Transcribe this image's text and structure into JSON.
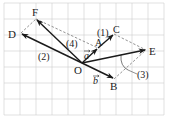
{
  "diagram": {
    "type": "vector-grid",
    "grid": {
      "x0": 4,
      "y0": 3,
      "cell": 16,
      "cols": 10,
      "rows": 7,
      "color": "#cfcfcf"
    },
    "colors": {
      "vector": "#1a1a1a",
      "dashed": "#777777",
      "label": "#222222"
    },
    "origin": {
      "name": "O",
      "x": 82,
      "y": 63
    },
    "points": [
      {
        "id": "A",
        "label": "A",
        "x": 98,
        "y": 48
      },
      {
        "id": "B",
        "label": "B",
        "x": 114,
        "y": 79
      },
      {
        "id": "C",
        "label": "C",
        "x": 114,
        "y": 34
      },
      {
        "id": "D",
        "label": "D",
        "x": 21,
        "y": 33
      },
      {
        "id": "E",
        "label": "E",
        "x": 146,
        "y": 50
      },
      {
        "id": "F",
        "label": "F",
        "x": 36,
        "y": 19
      }
    ],
    "vectors": [
      {
        "from": "O",
        "to": "A",
        "name": "a"
      },
      {
        "from": "O",
        "to": "B",
        "name": "b"
      },
      {
        "from": "A",
        "to": "C",
        "name": "(1)"
      },
      {
        "from": "O",
        "to": "D",
        "name": "(2)"
      },
      {
        "from": "O",
        "to": "E",
        "name": "(3)"
      },
      {
        "from": "O",
        "to": "F",
        "name": "(4)"
      }
    ],
    "labels": {
      "O": "O",
      "A": "A",
      "B": "B",
      "C": "C",
      "D": "D",
      "E": "E",
      "F": "F",
      "vec_a": "a",
      "vec_b": "b",
      "part1": "(1)",
      "part2": "(2)",
      "part3": "(3)",
      "part4": "(4)"
    }
  }
}
